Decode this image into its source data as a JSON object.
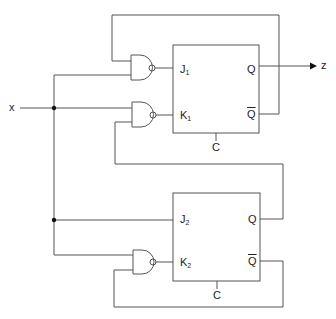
{
  "diagram": {
    "type": "sequential logic circuit",
    "input": {
      "label": "x"
    },
    "output": {
      "label": "z"
    },
    "flipflops": [
      {
        "name": "FF1",
        "j_label": "J",
        "j_sub": "1",
        "k_label": "K",
        "k_sub": "1",
        "q_label": "Q",
        "qbar_label": "Q",
        "clock_label": "C"
      },
      {
        "name": "FF2",
        "j_label": "J",
        "j_sub": "2",
        "k_label": "K",
        "k_sub": "2",
        "q_label": "Q",
        "qbar_label": "Q",
        "clock_label": "C"
      }
    ],
    "gates": [
      {
        "type": "NAND",
        "output_to": "J1",
        "inputs": [
          "Qbar1",
          "x"
        ]
      },
      {
        "type": "NAND",
        "output_to": "K1",
        "inputs": [
          "x",
          "Q2"
        ]
      },
      {
        "type": "NAND",
        "output_to": "K2",
        "inputs": [
          "x",
          "Qbar2"
        ]
      }
    ],
    "connections": [
      "x -> J2",
      "Q1 -> z"
    ],
    "colors": {
      "line": "#555555",
      "text": "#222222",
      "background": "#ffffff"
    }
  }
}
